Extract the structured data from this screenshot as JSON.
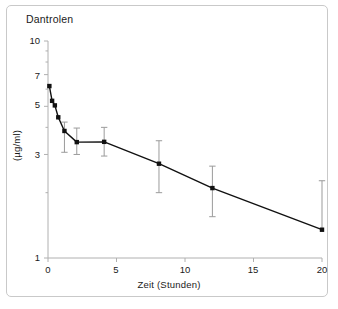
{
  "chart_data": {
    "type": "line",
    "title": "Dantrolen",
    "xlabel": "Zeit (Stunden)",
    "ylabel": "(µg/ml)",
    "yscale": "log",
    "xlim": [
      0,
      20
    ],
    "ylim": [
      1,
      10
    ],
    "grid": false,
    "legend": null,
    "xticks": [
      0,
      5,
      10,
      15,
      20
    ],
    "xtick_labels": [
      "0",
      "5",
      "10",
      "15",
      "20"
    ],
    "yticks": [
      1,
      3,
      5,
      7,
      10
    ],
    "ytick_labels": [
      "1",
      "3",
      "5",
      "7",
      "10"
    ],
    "x": [
      0.1,
      0.3,
      0.5,
      0.75,
      1.2,
      2.1,
      4.1,
      8.1,
      12.0,
      20.0
    ],
    "values": [
      6.2,
      5.3,
      5.05,
      4.45,
      3.85,
      3.42,
      3.43,
      2.72,
      2.1,
      1.35
    ],
    "yerr_low": [
      0,
      0,
      0,
      0,
      0.78,
      0.42,
      0.48,
      0.72,
      0.55,
      0.0
    ],
    "yerr_high": [
      0,
      0,
      0,
      0,
      0.38,
      0.55,
      0.57,
      0.75,
      0.55,
      0.92
    ],
    "marker": "square",
    "marker_color": "#111111",
    "line_color": "#111111",
    "errorbar_color": "#9b9b9b",
    "axis_color": "#b0b0b0",
    "frame_color": "#c9c9c9",
    "points": [
      {
        "t": 0.1,
        "c": 6.2
      },
      {
        "t": 0.3,
        "c": 5.3
      },
      {
        "t": 0.5,
        "c": 5.05
      },
      {
        "t": 0.75,
        "c": 4.45
      },
      {
        "t": 1.2,
        "c": 3.85
      },
      {
        "t": 2.1,
        "c": 3.42
      },
      {
        "t": 4.1,
        "c": 3.43
      },
      {
        "t": 8.1,
        "c": 2.72
      },
      {
        "t": 12.0,
        "c": 2.1
      },
      {
        "t": 20.0,
        "c": 1.35
      }
    ]
  },
  "figure": {
    "title": "Dantrolen",
    "xlabel": "Zeit (Stunden)",
    "ylabel": "(µg/ml)",
    "ytick_labels": [
      "10",
      "7",
      "5",
      "3",
      "1"
    ],
    "xtick_labels": [
      "0",
      "5",
      "10",
      "15",
      "20"
    ]
  }
}
